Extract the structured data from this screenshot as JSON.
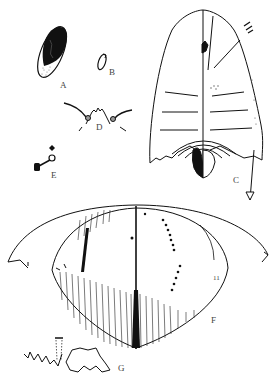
{
  "figure": {
    "panels": [
      {
        "id": "A",
        "label": "A",
        "x": 60,
        "y": 79
      },
      {
        "id": "B",
        "label": "B",
        "x": 109,
        "y": 67
      },
      {
        "id": "C",
        "label": "C",
        "x": 233,
        "y": 175
      },
      {
        "id": "D",
        "label": "D",
        "x": 96,
        "y": 121
      },
      {
        "id": "E",
        "label": "E",
        "x": 51,
        "y": 169
      },
      {
        "id": "F",
        "label": "F",
        "x": 211,
        "y": 315
      },
      {
        "id": "G",
        "label": "G",
        "x": 118,
        "y": 363
      }
    ],
    "annotations": {
      "f_marks": "11"
    },
    "colors": {
      "ink": "#111111",
      "stipple": "#555555",
      "background": "#ffffff"
    }
  }
}
